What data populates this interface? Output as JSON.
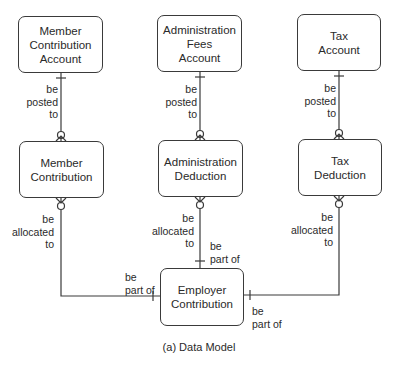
{
  "diagram": {
    "type": "entity-relationship data model",
    "caption": "(a) Data Model",
    "entities": {
      "member_contribution_account": "Member\nContribution\nAccount",
      "administration_fees_account": "Administration\nFees\nAccount",
      "tax_account": "Tax\nAccount",
      "member_contribution": "Member\nContribution",
      "administration_deduction": "Administration\nDeduction",
      "tax_deduction": "Tax\nDeduction",
      "employer_contribution": "Employer\nContribution"
    },
    "relationships": {
      "mca_posted": "be\nposted\nto",
      "afa_posted": "be\nposted\nto",
      "ta_posted": "be\nposted\nto",
      "mc_allocated": "be\nallocated\nto",
      "ad_allocated": "be\nallocated\nto",
      "td_allocated": "be\nallocated\nto",
      "ec_part_left": "be\npart of",
      "ec_part_top": "be\npart of",
      "ec_part_right": "be\npart of"
    }
  }
}
